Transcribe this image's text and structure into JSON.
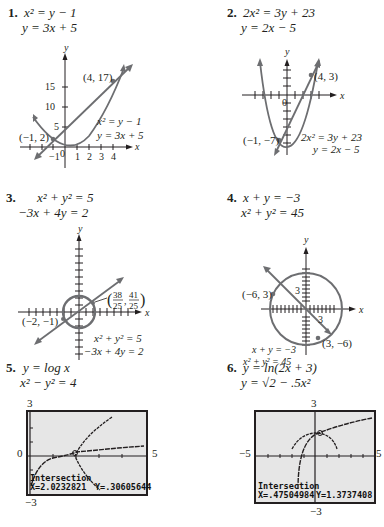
{
  "problems": [
    {
      "number": "1.",
      "equations": [
        "x² =  y − 1",
        "y = 3x + 5"
      ],
      "graph": {
        "axis_labels": {
          "x": "x",
          "y": "y"
        },
        "y_ticks": [
          "5",
          "10",
          "15"
        ],
        "x_ticks": [
          "−1",
          "0",
          "1",
          "2",
          "3",
          "4"
        ],
        "points": [
          "(4, 17)",
          "(−1, 2)"
        ],
        "legend": [
          "x² = y − 1",
          "y = 3x + 5"
        ]
      }
    },
    {
      "number": "2.",
      "equations": [
        "2x² = 3y + 23",
        "y  = 2x − 5"
      ],
      "graph": {
        "axis_labels": {
          "x": "x",
          "y": "y"
        },
        "origin": "0",
        "points": [
          "(4, 3)",
          "(−1, −7)"
        ],
        "legend": [
          "2x² = 3y + 23",
          "y = 2x − 5"
        ]
      }
    },
    {
      "number": "3.",
      "equations": [
        "x² +   y² = 5",
        "−3x  + 4y  = 2"
      ],
      "graph": {
        "axis_labels": {
          "x": "x",
          "y": "y"
        },
        "points": [
          "(38/25, 41/25)",
          "(−2, −1)"
        ],
        "point_frac": {
          "xn": "38",
          "xd": "25",
          "yn": "41",
          "yd": "25"
        },
        "legend": [
          "x² + y² = 5",
          "−3x + 4y = 2"
        ]
      }
    },
    {
      "number": "4.",
      "equations": [
        "x  + y  = −3",
        "x² + y² = 45"
      ],
      "graph": {
        "axis_labels": {
          "x": "x",
          "y": "y"
        },
        "tick_labels": {
          "x": "3",
          "y": "3"
        },
        "points": [
          "(−6, 3)",
          "(3, −6)"
        ],
        "legend": [
          "x + y = −3",
          "x² + y² = 45"
        ]
      }
    },
    {
      "number": "5.",
      "equations": [
        "y = log x",
        "x² − y² = 4"
      ],
      "calculator": {
        "window": {
          "ymax": "3",
          "ymin": "−3",
          "xmin": "0",
          "xmax": "5"
        },
        "title": "Intersection",
        "x_readout": "X=2.0232821",
        "y_readout": "Y=.30605644"
      }
    },
    {
      "number": "6.",
      "equations": [
        "y = ln(2x + 3)",
        "y = √2 − .5x²"
      ],
      "calculator": {
        "window": {
          "ymax": "3",
          "ymin": "−3",
          "xmin": "−5",
          "xmax": "5"
        },
        "title": "Intersection",
        "x_readout": "X=.47504984",
        "y_readout": "Y=1.3737408"
      }
    }
  ],
  "colors": {
    "ink": "#231f20",
    "curve": "#6d6e71",
    "screen": "#e6e6e6"
  }
}
